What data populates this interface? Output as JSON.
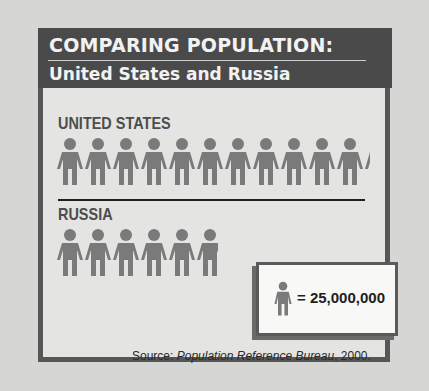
{
  "header": {
    "title_line1": "COMPARING POPULATION:",
    "title_line2": "United States and Russia"
  },
  "rows": [
    {
      "label": "UNITED STATES",
      "icon_count": 11.2
    },
    {
      "label": "RUSSIA",
      "icon_count": 5.8
    }
  ],
  "key": {
    "icon": "person-icon",
    "text": "= 25,000,000"
  },
  "source": {
    "prefix": "Source: ",
    "publication": "Population Reference Bureau",
    "suffix": ", 2000."
  },
  "colors": {
    "header_bg": "#4a4a4a",
    "figure": "#7a7a7a",
    "frame": "#565656"
  },
  "chart_data": {
    "type": "pictograph",
    "title": "COMPARING POPULATION: United States and Russia",
    "categories": [
      "United States",
      "Russia"
    ],
    "unit_value": 25000000,
    "icons": [
      11.2,
      5.8
    ],
    "values": [
      280000000,
      145000000
    ],
    "legend": "1 figure = 25,000,000",
    "source": "Source: Population Reference Bureau, 2000."
  }
}
